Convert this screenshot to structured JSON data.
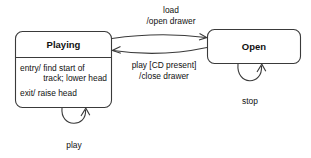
{
  "diagram": {
    "kind": "uml-state-machine-diagram",
    "background_color": "#ffffff",
    "line_color": "#3a3a3a",
    "text_color": "#111111",
    "states": [
      {
        "id": "playing",
        "name": "Playing",
        "activities": [
          "entry/ find start of",
          "track; lower head",
          "exit/ raise head"
        ],
        "activity_lines": {
          "entry_line_1": "entry/ find start of",
          "entry_line_2": "track; lower head",
          "exit_line": "exit/ raise head"
        }
      },
      {
        "id": "open",
        "name": "Open",
        "activities": []
      }
    ],
    "transitions": [
      {
        "id": "playing-to-open",
        "from": "playing",
        "to": "open",
        "label_lines": [
          "load",
          "/open drawer"
        ],
        "trigger": "load",
        "effect": "/open drawer"
      },
      {
        "id": "open-to-playing",
        "from": "open",
        "to": "playing",
        "label_lines": [
          "play [CD present]",
          "/close drawer"
        ],
        "trigger": "play [CD present]",
        "effect": "/close drawer"
      },
      {
        "id": "playing-self-loop",
        "from": "playing",
        "to": "playing",
        "label_lines": [
          "play"
        ],
        "trigger": "play",
        "effect": ""
      },
      {
        "id": "open-self-loop",
        "from": "open",
        "to": "open",
        "label_lines": [
          "stop"
        ],
        "trigger": "stop",
        "effect": ""
      }
    ]
  }
}
